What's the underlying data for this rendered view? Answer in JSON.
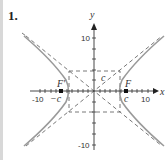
{
  "problem_number": "1.",
  "axes": {
    "x_label": "x",
    "y_label": "y",
    "x_ticks": [
      "-10",
      "10"
    ],
    "y_ticks": [
      "10",
      "-10"
    ]
  },
  "labels": {
    "focus_right": "F",
    "focus_left": "F'",
    "c_right": "c",
    "c_left": "−c",
    "c_diag": "c"
  },
  "figure": {
    "type": "hyperbola",
    "orientation": "horizontal",
    "a": 4.6,
    "b": 3.7,
    "c": 6,
    "range": [
      -12,
      12
    ],
    "curve_color": "#999999",
    "axis_color": "#333333",
    "dash_color": "#555555"
  }
}
